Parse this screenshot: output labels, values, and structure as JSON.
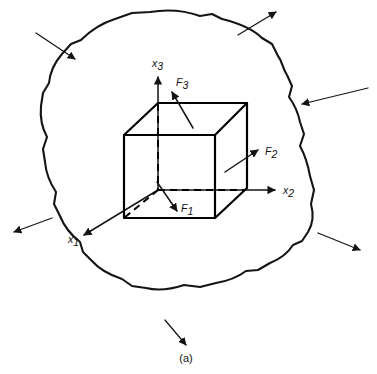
{
  "figure": {
    "caption": "(a)",
    "background_color": "#ffffff",
    "line_color": "#141414"
  },
  "axes": [
    {
      "id": "x3",
      "base": "x",
      "subscript": "3",
      "direction": "up",
      "label_x": 152,
      "label_y": 67
    },
    {
      "id": "x2",
      "base": "x",
      "subscript": "2",
      "direction": "right",
      "label_x": 283,
      "label_y": 194
    },
    {
      "id": "x1",
      "base": "x",
      "subscript": "1",
      "direction": "down-left",
      "label_x": 68,
      "label_y": 243
    }
  ],
  "forces": [
    {
      "id": "F3",
      "base": "F",
      "subscript": "3",
      "direction": "up-left",
      "label_x": 176,
      "label_y": 86
    },
    {
      "id": "F2",
      "base": "F",
      "subscript": "2",
      "direction": "up-right",
      "label_x": 265,
      "label_y": 155
    },
    {
      "id": "F1",
      "base": "F",
      "subscript": "1",
      "direction": "down-right",
      "label_x": 181,
      "label_y": 212
    }
  ],
  "boundary_loads": [
    {
      "id": "load-top-left",
      "direction": "inward",
      "angle_deg": 45
    },
    {
      "id": "load-top-right",
      "direction": "outward",
      "angle_deg": 315
    },
    {
      "id": "load-right-upper",
      "direction": "inward",
      "angle_deg": 200
    },
    {
      "id": "load-right-lower",
      "direction": "outward",
      "angle_deg": 25
    },
    {
      "id": "load-left",
      "direction": "outward",
      "angle_deg": 205
    },
    {
      "id": "load-bottom",
      "direction": "outward",
      "angle_deg": 70
    }
  ],
  "element": {
    "shape": "cube",
    "edge_style_visible": "solid",
    "edge_style_hidden": "dashed"
  }
}
